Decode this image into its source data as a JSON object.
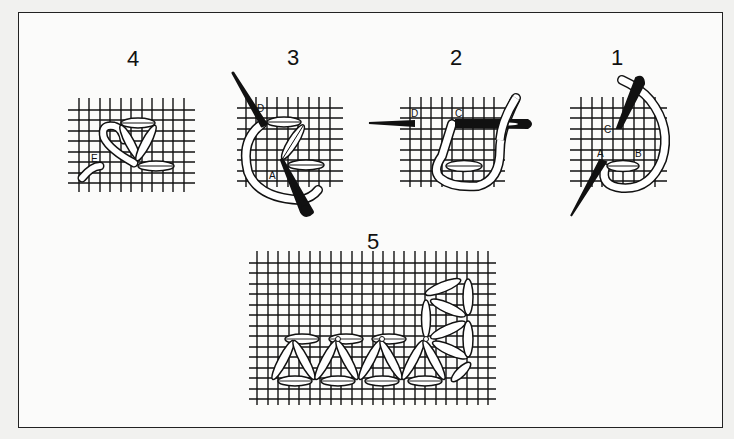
{
  "diagram": {
    "steps": [
      {
        "number": "1",
        "points": [
          "A",
          "B",
          "C"
        ]
      },
      {
        "number": "2",
        "points": [
          "C",
          "D"
        ]
      },
      {
        "number": "3",
        "points": [
          "A",
          "D"
        ]
      },
      {
        "number": "4",
        "points": [
          "E"
        ]
      },
      {
        "number": "5",
        "points": []
      }
    ],
    "colors": {
      "background": "#f1f1ef",
      "paper": "#fbfbfa",
      "ink": "#111111",
      "thread": "#ffffff"
    }
  }
}
